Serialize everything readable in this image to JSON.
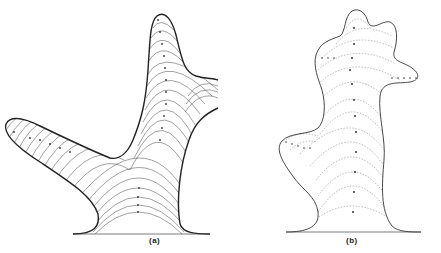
{
  "figure": {
    "panels": [
      {
        "id": "a",
        "label": "(a)",
        "description": "Y-shaped branching outline with dense nested arc growth lines",
        "baseline": {
          "x1": 73,
          "x2": 210,
          "y": 234
        }
      },
      {
        "id": "b",
        "label": "(b)",
        "description": "Multi-lobed branching outline with sparse dotted arc growth lines",
        "baseline": {
          "x1": 286,
          "x2": 421,
          "y": 232
        }
      }
    ],
    "colors": {
      "stroke": "#333333",
      "background": "#ffffff"
    }
  }
}
